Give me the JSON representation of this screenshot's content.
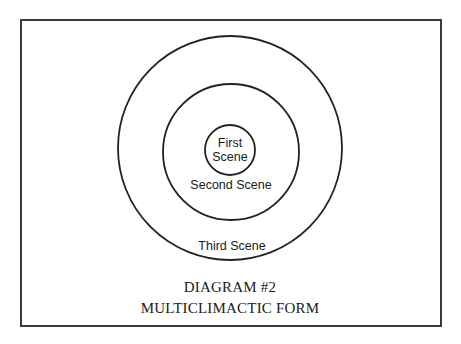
{
  "diagram": {
    "rings": [
      {
        "id": "inner",
        "label_lines": [
          "First",
          "Scene"
        ],
        "cx": 230,
        "cy": 150,
        "r": 25
      },
      {
        "id": "middle",
        "label": "Second Scene",
        "cx": 231,
        "cy": 152,
        "r": 68
      },
      {
        "id": "outer",
        "label": "Third Scene",
        "cx": 230,
        "cy": 148,
        "r": 112
      }
    ],
    "stroke_color": "#222222"
  },
  "caption": {
    "line1": "DIAGRAM #2",
    "line2": "MULTICLIMACTIC FORM"
  }
}
